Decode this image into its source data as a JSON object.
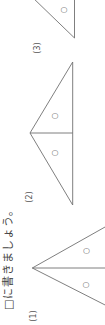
{
  "instruction": "□に書きましょう。",
  "figures": [
    {
      "label": "(1)",
      "marks": [
        "○",
        "○"
      ]
    },
    {
      "label": "(2)",
      "marks": [
        "○",
        "○"
      ]
    },
    {
      "label": "(3)",
      "marks": [
        "○"
      ]
    }
  ]
}
